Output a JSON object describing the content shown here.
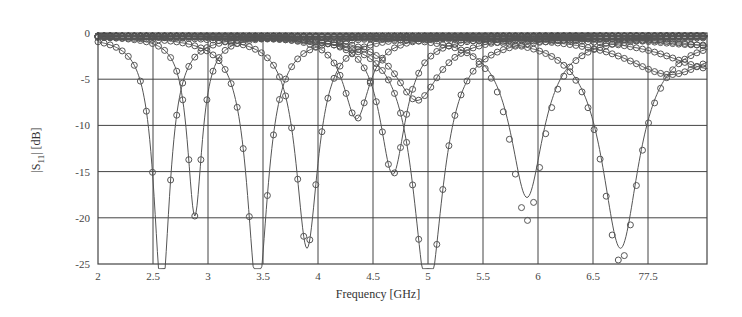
{
  "chart_data": {
    "type": "line",
    "title": "",
    "xlabel": "Frequency [GHz]",
    "ylabel": "|S11| [dB]",
    "ylabel_parts": {
      "pre": "|S",
      "sub": "11",
      "post": "| [dB]"
    },
    "xlim": [
      2,
      7.55
    ],
    "ylim": [
      -25,
      0
    ],
    "grid": true,
    "legend": "none",
    "x_ticks": [
      2,
      2.5,
      3,
      3.5,
      4,
      4.5,
      5,
      5.5,
      6,
      6.5,
      7
    ],
    "x_tick_labels": [
      "2",
      "2.5",
      "3",
      "3.5",
      "4",
      "4.5",
      "5",
      "5.5",
      "6",
      "6.5",
      "77.5"
    ],
    "y_ticks": [
      0,
      -5,
      -10,
      -15,
      -20,
      -25
    ],
    "y_tick_labels": [
      "0",
      "-5",
      "-10",
      "-15",
      "-20",
      "-25"
    ],
    "series_style": {
      "line": "solid (simulated)",
      "markers": "open circles (measured)"
    },
    "series": [
      {
        "name": "resonance 1",
        "f0": 2.58,
        "min_db": -28,
        "width": 0.22,
        "meas_offset": 0
      },
      {
        "name": "resonance 2",
        "f0": 2.88,
        "min_db": -19.5,
        "width": 0.2,
        "meas_offset": 0
      },
      {
        "name": "resonance 3",
        "f0": 3.45,
        "min_db": -28,
        "width": 0.28,
        "meas_offset": 0
      },
      {
        "name": "resonance 4",
        "f0": 3.9,
        "min_db": -23,
        "width": 0.3,
        "meas_offset": 0
      },
      {
        "name": "resonance 5",
        "f0": 4.35,
        "min_db": -9,
        "width": 0.35,
        "meas_offset": 0
      },
      {
        "name": "resonance 6",
        "f0": 4.68,
        "min_db": -15,
        "width": 0.35,
        "meas_offset": 0
      },
      {
        "name": "resonance 7",
        "f0": 5.0,
        "min_db": -28,
        "width": 0.4,
        "meas_offset": 0
      },
      {
        "name": "resonance 8",
        "f0": 4.9,
        "min_db": -7,
        "width": 0.6,
        "meas_offset": 0
      },
      {
        "name": "resonance 9",
        "f0": 5.9,
        "min_db": -17.5,
        "width": 0.45,
        "meas_offset": -2.5
      },
      {
        "name": "resonance 10",
        "f0": 6.75,
        "min_db": -23,
        "width": 0.5,
        "meas_offset": -1.5
      },
      {
        "name": "broad 1",
        "f0": 7.2,
        "min_db": -4.2,
        "width": 1.2,
        "meas_offset": 0
      },
      {
        "name": "broad 2",
        "f0": 7.6,
        "min_db": -3.6,
        "width": 1.3,
        "meas_offset": 0
      },
      {
        "name": "broad 3",
        "f0": 8.0,
        "min_db": -1.8,
        "width": 1.5,
        "meas_offset": 0
      },
      {
        "name": "broad 4",
        "f0": 7.5,
        "min_db": -1.0,
        "width": 1.6,
        "meas_offset": 0
      }
    ]
  },
  "colors": {
    "line": "#555555",
    "grid": "#444444",
    "marker": "#555555",
    "text": "#444444"
  }
}
